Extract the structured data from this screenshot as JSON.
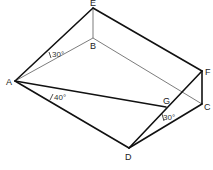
{
  "diagram": {
    "type": "geometry-3d-wedge",
    "vertices": {
      "A": {
        "label": "A",
        "x": 15,
        "y": 81
      },
      "B": {
        "label": "B",
        "x": 93,
        "y": 38
      },
      "C": {
        "label": "C",
        "x": 202,
        "y": 104
      },
      "D": {
        "label": "D",
        "x": 129,
        "y": 148
      },
      "E": {
        "label": "E",
        "x": 93,
        "y": 8
      },
      "F": {
        "label": "F",
        "x": 202,
        "y": 71
      },
      "G": {
        "label": "G",
        "x": 166,
        "y": 107
      }
    },
    "edges_thick": [
      "AE",
      "EF",
      "FC",
      "CD",
      "DA",
      "AG",
      "DF"
    ],
    "edges_thin": [
      "EB",
      "AB",
      "BC"
    ],
    "angles": [
      {
        "id": "angle-EAB",
        "text": "30°"
      },
      {
        "id": "angle-GAD",
        "text": "40°"
      },
      {
        "id": "angle-GDC",
        "text": "30°"
      }
    ]
  }
}
